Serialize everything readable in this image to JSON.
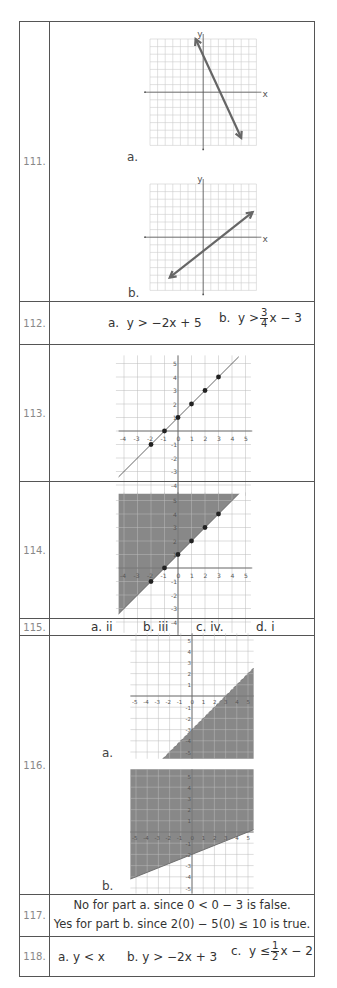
{
  "rows": [
    {
      "number": "111.",
      "parts": [
        {
          "label": "a."
        },
        {
          "label": "b."
        }
      ],
      "axis_x": "x",
      "axis_y": "y"
    },
    {
      "number": "112.",
      "a_label": "a.",
      "a_expr": "y > −2x + 5",
      "b_label": "b.",
      "b_expr_pre": "y >",
      "b_frac_num": "3",
      "b_frac_den": "4",
      "b_expr_post": "x − 3"
    },
    {
      "number": "113."
    },
    {
      "number": "114."
    },
    {
      "number": "115.",
      "answers": [
        "a.  ii",
        "b.  iii",
        "c.  iv.",
        "d.  i"
      ]
    },
    {
      "number": "116.",
      "parts": [
        {
          "label": "a."
        },
        {
          "label": "b."
        }
      ]
    },
    {
      "number": "117.",
      "line1": "No for part a. since  0 < 0 − 3  is false.",
      "line2": "Yes for part b. since  2(0) − 5(0) ≤ 10  is true."
    },
    {
      "number": "118.",
      "a": "a.  y < x",
      "b": "b.  y > −2x + 3",
      "c_label": "c.",
      "c_pre": "y ≤",
      "c_frac_num": "1",
      "c_frac_den": "2",
      "c_post": "x − 2"
    }
  ],
  "graph_113": {
    "x_ticks": [
      "-4",
      "-3",
      "-2",
      "-1",
      "0",
      "1",
      "2",
      "3",
      "4",
      "5"
    ],
    "y_ticks": [
      "5",
      "4",
      "3",
      "2",
      "1",
      "-1",
      "-2",
      "-3",
      "-4"
    ]
  },
  "graph_116": {
    "x_ticks": [
      "-5",
      "-4",
      "-3",
      "-2",
      "-1",
      "0",
      "1",
      "2",
      "3",
      "4",
      "5"
    ],
    "y_ticks": [
      "5",
      "4",
      "3",
      "2",
      "1",
      "-1",
      "-2",
      "-3",
      "-4",
      "-5"
    ]
  },
  "chart_data": [
    {
      "type": "line",
      "title": "111a",
      "description": "line with negative slope, arrows both ends",
      "points": [
        [
          -1,
          7
        ],
        [
          5,
          -6
        ]
      ]
    },
    {
      "type": "line",
      "title": "111b",
      "description": "line with positive slope, arrows both ends",
      "points": [
        [
          -5,
          -6
        ],
        [
          7,
          4
        ]
      ]
    },
    {
      "type": "line",
      "title": "113",
      "equation": "y = x + 1",
      "points": [
        [
          -2,
          -1
        ],
        [
          -1,
          0
        ],
        [
          0,
          1
        ],
        [
          1,
          2
        ],
        [
          2,
          3
        ],
        [
          3,
          4
        ]
      ],
      "xlim": [
        -4,
        5
      ],
      "ylim": [
        -4,
        5
      ]
    },
    {
      "type": "area",
      "title": "114",
      "equation": "y ≥ x + 1",
      "shaded": "above",
      "points": [
        [
          -2,
          -1
        ],
        [
          -1,
          0
        ],
        [
          0,
          1
        ],
        [
          1,
          2
        ],
        [
          2,
          3
        ],
        [
          3,
          4
        ]
      ],
      "xlim": [
        -4,
        5
      ],
      "ylim": [
        -4,
        5
      ]
    },
    {
      "type": "area",
      "title": "116a",
      "equation": "y < x − 3",
      "boundary": "dashed",
      "shaded": "below",
      "xlim": [
        -5,
        5
      ],
      "ylim": [
        -5,
        5
      ]
    },
    {
      "type": "area",
      "title": "116b",
      "equation": "y > (2/5)x − 2",
      "boundary": "solid",
      "shaded": "above",
      "xlim": [
        -5,
        5
      ],
      "ylim": [
        -5,
        5
      ]
    }
  ]
}
